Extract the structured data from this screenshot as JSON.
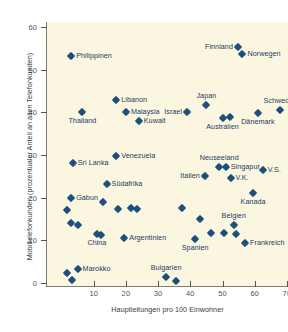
{
  "figure": {
    "background": "#ffffff",
    "plot_background": "#faf6e0",
    "marker_color": "#1c4f7c"
  },
  "chart_data": {
    "type": "scatter",
    "title": "",
    "xlabel": "Hauptleitungen pro 100 Einwohner",
    "ylabel": "Mobiltelefonkunden (prozentualer Anteil an allen Telefonkunden)",
    "xlim": [
      0,
      72
    ],
    "ylim": [
      0,
      62
    ],
    "xticks": [
      10,
      20,
      30,
      40,
      50,
      60,
      70
    ],
    "yticks": [
      0,
      10,
      20,
      30,
      40,
      50,
      60
    ],
    "grid": false,
    "legend": null,
    "points": [
      {
        "label": "Philippinen",
        "x": 3.0,
        "y": 53.2,
        "pos": "lr"
      },
      {
        "label": "Libanon",
        "x": 17.0,
        "y": 42.8,
        "pos": "lr"
      },
      {
        "label": "Malaysia",
        "x": 20.0,
        "y": 40.1,
        "pos": "lr"
      },
      {
        "label": "Kuwait",
        "x": 24.0,
        "y": 38.0,
        "pos": "lr"
      },
      {
        "label": "Thailand",
        "x": 6.5,
        "y": 40.0,
        "pos": "below"
      },
      {
        "label": "Israel",
        "x": 39.0,
        "y": 40.0,
        "pos": "rl"
      },
      {
        "label": "Japan",
        "x": 45.0,
        "y": 41.8,
        "pos": "above"
      },
      {
        "label": "Australien",
        "x": 50.0,
        "y": 38.7,
        "pos": "below"
      },
      {
        "label": "",
        "x": 52.2,
        "y": 38.9,
        "pos": "none"
      },
      {
        "label": "Dänemark",
        "x": 61.0,
        "y": 39.8,
        "pos": "below"
      },
      {
        "label": "Schweden",
        "x": 68.0,
        "y": 40.5,
        "pos": "above"
      },
      {
        "label": "Finnland",
        "x": 54.8,
        "y": 55.2,
        "pos": "rl"
      },
      {
        "label": "Norwegen",
        "x": 56.2,
        "y": 53.6,
        "pos": "lr"
      },
      {
        "label": "Venezuela",
        "x": 17.0,
        "y": 29.8,
        "pos": "lr"
      },
      {
        "label": "Sri Lanka",
        "x": 3.5,
        "y": 28.1,
        "pos": "lr"
      },
      {
        "label": "Südafrika",
        "x": 14.0,
        "y": 23.3,
        "pos": "lr"
      },
      {
        "label": "Gabun",
        "x": 3.0,
        "y": 20.0,
        "pos": "lr"
      },
      {
        "label": "Neuseeland",
        "x": 49.0,
        "y": 27.1,
        "pos": "above"
      },
      {
        "label": "Singapur",
        "x": 51.0,
        "y": 27.1,
        "pos": "lr"
      },
      {
        "label": "V.S.",
        "x": 62.5,
        "y": 26.5,
        "pos": "lr"
      },
      {
        "label": "Italien",
        "x": 44.5,
        "y": 25.0,
        "pos": "rl"
      },
      {
        "label": "V.K.",
        "x": 52.5,
        "y": 24.7,
        "pos": "lr"
      },
      {
        "label": "Kanada",
        "x": 59.5,
        "y": 21.0,
        "pos": "below"
      },
      {
        "label": "Chile",
        "x": 21.5,
        "y": 17.5,
        "pos": "none"
      },
      {
        "label": "",
        "x": 23.5,
        "y": 17.3,
        "pos": "none"
      },
      {
        "label": "",
        "x": 17.5,
        "y": 17.4,
        "pos": "none"
      },
      {
        "label": "",
        "x": 13.0,
        "y": 19.0,
        "pos": "none"
      },
      {
        "label": "",
        "x": 1.8,
        "y": 17.0,
        "pos": "none"
      },
      {
        "label": "",
        "x": 3.0,
        "y": 14.0,
        "pos": "none"
      },
      {
        "label": "",
        "x": 5.0,
        "y": 13.7,
        "pos": "none"
      },
      {
        "label": "China",
        "x": 11.0,
        "y": 11.5,
        "pos": "below"
      },
      {
        "label": "",
        "x": 12.4,
        "y": 11.3,
        "pos": "none"
      },
      {
        "label": "Argentinien",
        "x": 19.5,
        "y": 10.5,
        "pos": "lr"
      },
      {
        "label": "",
        "x": 37.5,
        "y": 17.5,
        "pos": "none"
      },
      {
        "label": "",
        "x": 43.0,
        "y": 15.0,
        "pos": "none"
      },
      {
        "label": "Belgien",
        "x": 53.5,
        "y": 13.7,
        "pos": "above"
      },
      {
        "label": "",
        "x": 46.5,
        "y": 11.8,
        "pos": "none"
      },
      {
        "label": "",
        "x": 50.5,
        "y": 11.7,
        "pos": "none"
      },
      {
        "label": "",
        "x": 54.3,
        "y": 11.5,
        "pos": "none"
      },
      {
        "label": "Spanien",
        "x": 41.5,
        "y": 10.4,
        "pos": "below"
      },
      {
        "label": "Frankreich",
        "x": 57.0,
        "y": 9.4,
        "pos": "lr"
      },
      {
        "label": "Marokko",
        "x": 5.0,
        "y": 3.2,
        "pos": "lr"
      },
      {
        "label": "",
        "x": 1.8,
        "y": 2.4,
        "pos": "none"
      },
      {
        "label": "",
        "x": 3.2,
        "y": 0.6,
        "pos": "none"
      },
      {
        "label": "Bulgarien",
        "x": 32.5,
        "y": 1.3,
        "pos": "above"
      },
      {
        "label": "",
        "x": 35.5,
        "y": 0.5,
        "pos": "none"
      }
    ]
  }
}
